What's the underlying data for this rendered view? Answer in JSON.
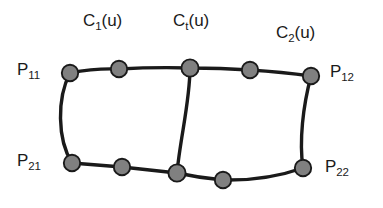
{
  "figure": {
    "type": "curve-network-diagram",
    "background_color": "#ffffff",
    "line_color": "#1a1a1a",
    "node_fill_color": "#808080",
    "node_stroke_color": "#1a1a1a",
    "text_color": "#1a1a1a"
  },
  "labels": {
    "c1": {
      "base": "C",
      "sub": "1",
      "arg": "(u)"
    },
    "ct": {
      "base": "C",
      "sub": "t",
      "arg": "(u)"
    },
    "c2": {
      "base": "C",
      "sub": "2",
      "arg": "(u)"
    },
    "p11": {
      "base": "P",
      "sub": "11"
    },
    "p12": {
      "base": "P",
      "sub": "12"
    },
    "p21": {
      "base": "P",
      "sub": "21"
    },
    "p22": {
      "base": "P",
      "sub": "22"
    }
  },
  "geometry": {
    "top_curve_nodes": [
      {
        "name": "P11",
        "x": 70,
        "y": 73
      },
      {
        "name": "t2",
        "x": 119,
        "y": 69
      },
      {
        "name": "t3",
        "x": 190,
        "y": 68
      },
      {
        "name": "t4",
        "x": 250,
        "y": 70
      },
      {
        "name": "P12",
        "x": 311,
        "y": 76
      }
    ],
    "bottom_curve_nodes": [
      {
        "name": "P21",
        "x": 72,
        "y": 163
      },
      {
        "name": "b2",
        "x": 122,
        "y": 167
      },
      {
        "name": "b3",
        "x": 177,
        "y": 173
      },
      {
        "name": "b4",
        "x": 223,
        "y": 180
      },
      {
        "name": "P22",
        "x": 303,
        "y": 168
      }
    ],
    "paths": {
      "top": "M 70 73 Q 95 68 119 69 Q 155 67 190 68 Q 221 68 250 70 Q 282 72 311 76",
      "bottom": "M 72 163 Q 97 165 122 167 Q 150 170 177 173 Q 200 178 223 180 Q 266 181 303 168",
      "left": "M 70 73 C 58 98 58 138 72 163",
      "right": "M 311 76 C 304 105 300 140 303 168",
      "middle": "M 190 68 C 189 100 180 140 177 173"
    }
  }
}
